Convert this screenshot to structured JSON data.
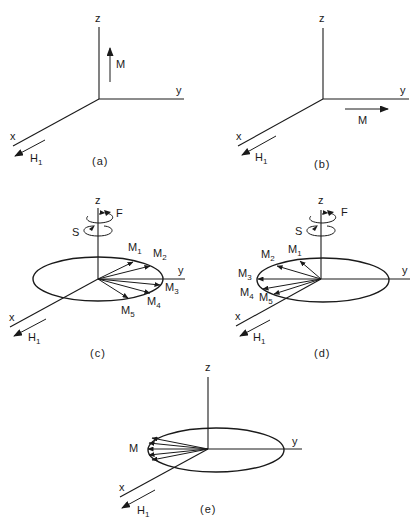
{
  "figure": {
    "panels": [
      {
        "id": "a",
        "caption": "(a)",
        "axes": {
          "z": "z",
          "y": "y",
          "x": "x"
        },
        "field": {
          "symbol": "H",
          "subscript": "1"
        },
        "magnetization": {
          "label": "M",
          "direction": "along +z"
        }
      },
      {
        "id": "b",
        "caption": "(b)",
        "axes": {
          "z": "z",
          "y": "y",
          "x": "x"
        },
        "field": {
          "symbol": "H",
          "subscript": "1"
        },
        "magnetization": {
          "label": "M",
          "direction": "along +y"
        }
      },
      {
        "id": "c",
        "caption": "(c)",
        "axes": {
          "z": "z",
          "y": "y",
          "x": "x"
        },
        "field": {
          "symbol": "H",
          "subscript": "1"
        },
        "rotation_labels": {
          "fast": "F",
          "slow": "S"
        },
        "vectors": [
          {
            "symbol": "M",
            "subscript": "1"
          },
          {
            "symbol": "M",
            "subscript": "2"
          },
          {
            "symbol": "M",
            "subscript": "3"
          },
          {
            "symbol": "M",
            "subscript": "4"
          },
          {
            "symbol": "M",
            "subscript": "5"
          }
        ]
      },
      {
        "id": "d",
        "caption": "(d)",
        "axes": {
          "z": "z",
          "y": "y",
          "x": "x"
        },
        "field": {
          "symbol": "H",
          "subscript": "1"
        },
        "rotation_labels": {
          "fast": "F",
          "slow": "S"
        },
        "vectors": [
          {
            "symbol": "M",
            "subscript": "1"
          },
          {
            "symbol": "M",
            "subscript": "2"
          },
          {
            "symbol": "M",
            "subscript": "3"
          },
          {
            "symbol": "M",
            "subscript": "4"
          },
          {
            "symbol": "M",
            "subscript": "5"
          }
        ]
      },
      {
        "id": "e",
        "caption": "(e)",
        "axes": {
          "z": "z",
          "y": "y",
          "x": "x"
        },
        "field": {
          "symbol": "H",
          "subscript": "1"
        },
        "magnetization": {
          "label": "M",
          "direction": "refocused along -y"
        }
      }
    ]
  }
}
